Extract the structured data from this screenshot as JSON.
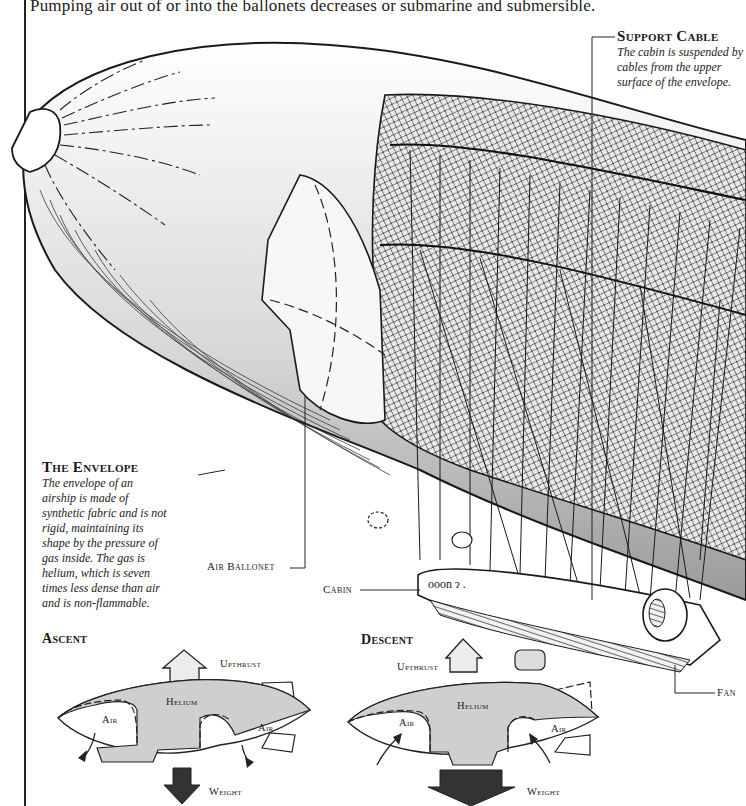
{
  "page": {
    "top_text_left": "Pumping air out of or into the ballonets decreases or",
    "top_text_right": "submarine and submersible."
  },
  "labels": {
    "support_cable": {
      "title": "Support Cable",
      "lines": [
        "The cabin is suspended by",
        "cables from the upper",
        "surface of the envelope."
      ]
    },
    "envelope": {
      "title": "The Envelope",
      "lines": [
        "The envelope of an",
        "airship is made of",
        "synthetic fabric and is not",
        "rigid, maintaining its",
        "shape by the pressure of",
        "gas inside. The gas is",
        "helium, which is seven",
        "times less dense than air",
        "and is non-flammable."
      ]
    },
    "air_ballonet": "Air Ballonet",
    "cabin": "Cabin",
    "fan": "Fan"
  },
  "diagrams": {
    "ascent": {
      "title": "Ascent",
      "upthrust": "Upthrust",
      "helium": "Helium",
      "air_left": "Air",
      "air_right": "Air",
      "weight": "Weight",
      "air_flow": "out"
    },
    "descent": {
      "title": "Descent",
      "upthrust": "Upthrust",
      "helium": "Helium",
      "air_left": "Air",
      "air_right": "Air",
      "weight": "Weight",
      "air_flow": "in"
    }
  },
  "colors": {
    "ink": "#1a1a1a",
    "helium_fill": "#cfcfcf",
    "upthrust_arrow": "#ececec",
    "weight_arrow": "#333333",
    "shading": "#bdbdbd"
  }
}
